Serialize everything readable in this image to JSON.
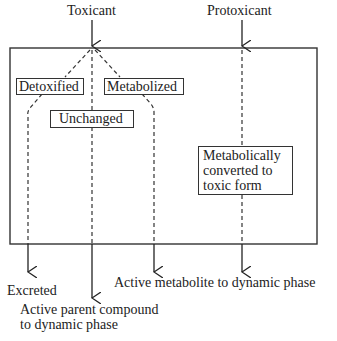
{
  "inputs": {
    "toxicant": "Toxicant",
    "protoxicant": "Protoxicant"
  },
  "boxes": {
    "detoxified": "Detoxified",
    "metabolized": "Metabolized",
    "unchanged": "Unchanged",
    "converted": [
      "Metabolically",
      "converted to",
      "toxic form"
    ]
  },
  "outputs": {
    "excreted": "Excreted",
    "active_parent": [
      "Active parent compound",
      "to dynamic phase"
    ],
    "active_metabolite": "Active metabolite to dynamic phase"
  }
}
